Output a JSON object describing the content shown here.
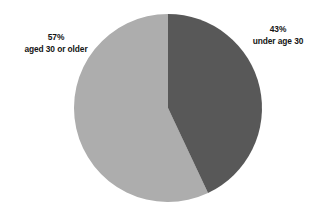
{
  "chart_data": {
    "type": "pie",
    "title": "",
    "subtitle": "",
    "xlabel": "",
    "ylabel": "",
    "legend_position": "none",
    "grid": false,
    "labels_placement": "outside",
    "start_angle_deg": 0,
    "direction": "clockwise",
    "categories": [
      "under age 30",
      "aged 30 or older"
    ],
    "values": [
      43,
      57
    ],
    "value_unit": "percent",
    "colors": [
      "#585858",
      "#ADADAD"
    ],
    "slices": [
      {
        "name": "under age 30",
        "percent_label": "43%",
        "description": "under age 30",
        "value": 43,
        "color": "#585858",
        "label_side": "right"
      },
      {
        "name": "aged 30 or older",
        "percent_label": "57%",
        "description": "aged 30 or older",
        "value": 57,
        "color": "#ADADAD",
        "label_side": "left"
      }
    ]
  },
  "figure": {
    "background_color": "#FFFFFF",
    "text_color": "#141414"
  }
}
